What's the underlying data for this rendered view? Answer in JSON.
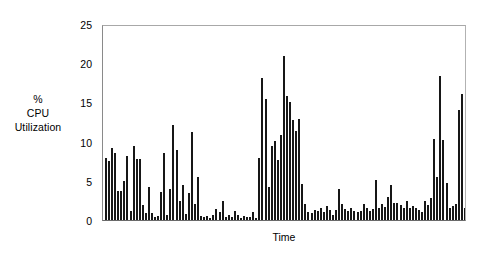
{
  "chart_data": {
    "type": "bar",
    "title": "",
    "xlabel": "Time",
    "ylabel": "% CPU Utilization",
    "ylabel_lines": [
      "%",
      "CPU",
      "Utilization"
    ],
    "ylim": [
      0,
      25
    ],
    "yticks": [
      0,
      5,
      10,
      15,
      20,
      25
    ],
    "ytick_labels": [
      "0",
      "5",
      "10",
      "15",
      "20",
      "25"
    ],
    "xticks": [],
    "xtick_labels": [],
    "grid": false,
    "legend": null,
    "bar_color": "#171717",
    "frame_color": "#9a9a9a",
    "n_bars": 118,
    "categories": [
      "t1",
      "t2",
      "t3",
      "t4",
      "t5",
      "t6",
      "t7",
      "t8",
      "t9",
      "t10",
      "t11",
      "t12",
      "t13",
      "t14",
      "t15",
      "t16",
      "t17",
      "t18",
      "t19",
      "t20",
      "t21",
      "t22",
      "t23",
      "t24",
      "t25",
      "t26",
      "t27",
      "t28",
      "t29",
      "t30",
      "t31",
      "t32",
      "t33",
      "t34",
      "t35",
      "t36",
      "t37",
      "t38",
      "t39",
      "t40",
      "t41",
      "t42",
      "t43",
      "t44",
      "t45",
      "t46",
      "t47",
      "t48",
      "t49",
      "t50",
      "t51",
      "t52",
      "t53",
      "t54",
      "t55",
      "t56",
      "t57",
      "t58",
      "t59",
      "t60",
      "t61",
      "t62",
      "t63",
      "t64",
      "t65",
      "t66",
      "t67",
      "t68",
      "t69",
      "t70",
      "t71",
      "t72",
      "t73",
      "t74",
      "t75",
      "t76",
      "t77",
      "t78",
      "t79",
      "t80",
      "t81",
      "t82",
      "t83",
      "t84",
      "t85",
      "t86",
      "t87",
      "t88",
      "t89",
      "t90",
      "t91",
      "t92",
      "t93",
      "t94",
      "t95",
      "t96",
      "t97",
      "t98",
      "t99",
      "t100",
      "t101",
      "t102",
      "t103",
      "t104",
      "t105",
      "t106",
      "t107",
      "t108",
      "t109",
      "t110",
      "t111",
      "t112",
      "t113",
      "t114",
      "t115",
      "t116",
      "t117",
      "t118"
    ],
    "values": [
      8.0,
      7.6,
      9.3,
      8.7,
      3.7,
      3.8,
      5.0,
      8.3,
      1.2,
      9.5,
      7.9,
      7.9,
      1.9,
      0.9,
      4.3,
      0.9,
      0.4,
      0.5,
      3.6,
      8.6,
      0.6,
      4.0,
      12.3,
      9.0,
      2.5,
      4.5,
      0.8,
      3.5,
      11.4,
      2.0,
      5.5,
      0.5,
      0.4,
      0.5,
      0.3,
      0.6,
      1.4,
      1.0,
      2.5,
      0.4,
      0.6,
      0.4,
      1.1,
      0.6,
      0.3,
      0.5,
      0.4,
      0.4,
      1.0,
      0.3,
      8.0,
      18.3,
      15.6,
      4.3,
      9.5,
      10.2,
      7.7,
      11.0,
      21.2,
      16.0,
      15.2,
      12.9,
      11.5,
      13.0,
      4.7,
      2.1,
      1.0,
      0.9,
      1.3,
      1.2,
      1.5,
      1.0,
      1.8,
      1.3,
      0.7,
      1.3,
      4.0,
      2.0,
      1.4,
      1.1,
      1.5,
      1.2,
      1.0,
      1.1,
      2.0,
      1.5,
      1.2,
      1.4,
      5.2,
      1.5,
      2.0,
      1.7,
      3.0,
      4.5,
      2.2,
      2.2,
      1.9,
      1.5,
      2.5,
      1.6,
      1.8,
      1.5,
      1.3,
      1.0,
      2.4,
      1.9,
      2.8,
      10.4,
      5.6,
      18.6,
      10.3,
      4.8,
      1.6,
      1.8,
      2.0,
      14.2,
      16.3,
      1.5
    ]
  }
}
